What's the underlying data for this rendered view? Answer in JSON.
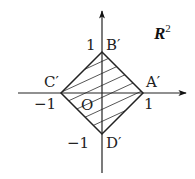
{
  "figure": {
    "space_label": "R",
    "space_superscript": "2",
    "origin_label": "O",
    "vertices": [
      {
        "name": "A′",
        "coord": [
          1,
          0
        ]
      },
      {
        "name": "B′",
        "coord": [
          0,
          1
        ]
      },
      {
        "name": "C′",
        "coord": [
          -1,
          0
        ]
      },
      {
        "name": "D′",
        "coord": [
          0,
          -1
        ]
      }
    ],
    "ticks": {
      "x_pos": "1",
      "x_neg": "−1",
      "y_pos": "1",
      "y_neg": "−1"
    },
    "region": "|x| + |y| ≤ 1 (hatched square)",
    "colors": {
      "stroke": "#222222",
      "hatch": "#444444",
      "background": "#ffffff"
    }
  }
}
